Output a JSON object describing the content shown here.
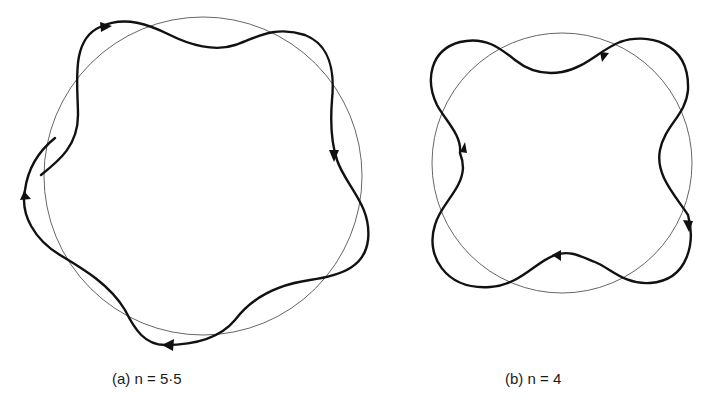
{
  "figure": {
    "panels": [
      {
        "id": "a",
        "label": "(a)",
        "equation": "n = 5·5",
        "caption": "(a)  n = 5·5",
        "description": "Wavy closed-ish orbit with 5.5 waves around a reference circle (non-closing, ends overlap on left side)",
        "arrows": 4
      },
      {
        "id": "b",
        "label": "(b)",
        "equation": "n = 4",
        "caption": "(b)  n = 4",
        "description": "Closed wavy orbit with 4 waves around a reference circle",
        "arrows": 4
      }
    ],
    "colors": {
      "curve": "#111111",
      "circle": "#555555",
      "background": "#ffffff"
    }
  }
}
